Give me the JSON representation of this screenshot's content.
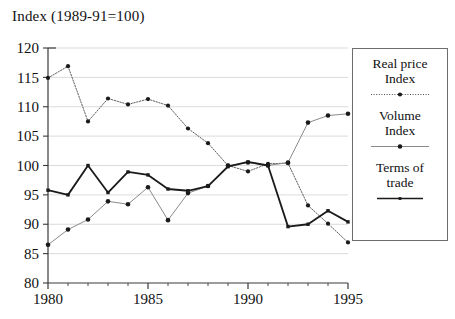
{
  "chart_title": "Index (1989-91=100)",
  "legend": {
    "entries": [
      {
        "label": "Real price\nIndex",
        "style": "dotted-marker",
        "color": "#1a1a1a"
      },
      {
        "label": "Volume\nIndex",
        "style": "thin-marker",
        "color": "#6b6b6b"
      },
      {
        "label": "Terms of\ntrade",
        "style": "solid-marker",
        "color": "#1a1a1a"
      }
    ]
  },
  "chart_data": {
    "type": "line",
    "title": "Index (1989-91=100)",
    "xlabel": "",
    "ylabel": "Index (1989-91=100)",
    "xlim": [
      1980,
      1995
    ],
    "ylim": [
      80,
      120
    ],
    "grid": true,
    "legend_position": "right-outside",
    "x": [
      1980,
      1981,
      1982,
      1983,
      1984,
      1985,
      1986,
      1987,
      1988,
      1989,
      1990,
      1991,
      1992,
      1993,
      1994,
      1995
    ],
    "xticks": [
      1980,
      1985,
      1990,
      1995
    ],
    "xtick_labels": [
      "1980",
      "1985",
      "1990",
      "1995"
    ],
    "yticks": [
      80,
      85,
      90,
      95,
      100,
      105,
      110,
      115,
      120
    ],
    "ytick_labels": [
      "80",
      "85",
      "90",
      "95",
      "100",
      "105",
      "110",
      "115",
      "120"
    ],
    "series": [
      {
        "name": "Real price Index",
        "style": "dotted",
        "color": "#1a1a1a",
        "values": [
          114.9,
          116.9,
          107.5,
          111.4,
          110.4,
          111.3,
          110.2,
          106.3,
          103.8,
          100.0,
          99.0,
          100.3,
          100.4,
          93.2,
          90.1,
          86.9
        ]
      },
      {
        "name": "Volume Index",
        "style": "thin",
        "color": "#6b6b6b",
        "values": [
          86.5,
          89.1,
          90.8,
          93.9,
          93.4,
          96.3,
          90.7,
          95.3,
          96.5,
          100.0,
          100.5,
          100.0,
          100.5,
          107.3,
          108.5,
          108.8
        ]
      },
      {
        "name": "Terms of trade",
        "style": "solid",
        "color": "#1a1a1a",
        "values": [
          95.8,
          95.0,
          100.0,
          95.4,
          98.9,
          98.4,
          96.0,
          95.7,
          96.5,
          99.8,
          100.6,
          100.0,
          89.6,
          90.0,
          92.3,
          90.4
        ]
      }
    ]
  }
}
